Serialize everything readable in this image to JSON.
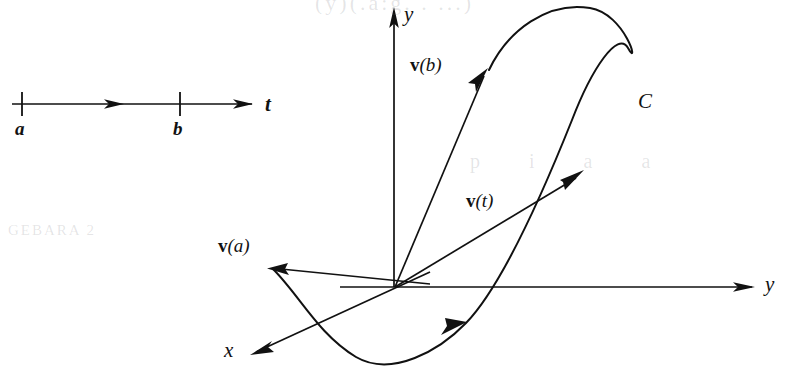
{
  "figure": {
    "type": "mathematical-diagram",
    "background_color": "#ffffff",
    "ink_color": "#111111",
    "width": 785,
    "height": 369
  },
  "parameter_axis": {
    "name": "t-axis",
    "axis_label": "t",
    "ticks": [
      {
        "label": "a",
        "x": 22
      },
      {
        "label": "b",
        "x": 180
      }
    ],
    "direction_arrows": 2
  },
  "space_axes": [
    {
      "name": "y-axis-vertical",
      "label": "y",
      "direction": "up"
    },
    {
      "name": "y-axis-horizontal",
      "label": "y",
      "direction": "right"
    },
    {
      "name": "x-axis",
      "label": "x",
      "direction": "down-left"
    }
  ],
  "curve": {
    "label": "C",
    "orientation": "counterclockwise",
    "direction_arrow_count": 1
  },
  "vectors": [
    {
      "name": "v-of-a",
      "vname": "v",
      "varg": "(a)",
      "note": "tangent at start of curve"
    },
    {
      "name": "v-of-b",
      "vname": "v",
      "varg": "(b)",
      "note": "tangent at end of curve"
    },
    {
      "name": "v-of-t",
      "vname": "v",
      "varg": "(t)",
      "note": "position vector to point on curve"
    }
  ],
  "ghost_text": {
    "top": "(y)(.a:g. . ...)",
    "mid_right": "p i a a",
    "mid_left": "GEBARA 2"
  }
}
